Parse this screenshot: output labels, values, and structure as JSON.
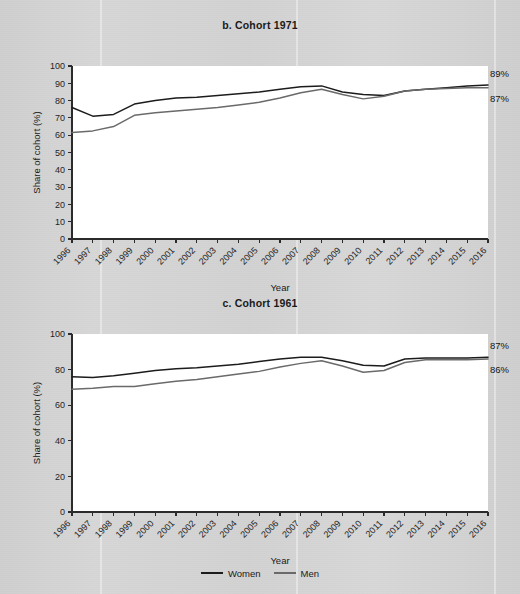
{
  "figure": {
    "axis_x_title": "Year",
    "axis_y_title": "Share of cohort (%)",
    "legend": [
      {
        "label": "Women",
        "color": "#1c1c1c",
        "key": "women"
      },
      {
        "label": "Men",
        "color": "#6a6a6a",
        "key": "men"
      }
    ]
  },
  "chart_data": [
    {
      "id": "panel-b",
      "type": "line",
      "title": "b.  Cohort 1971",
      "xlabel": "Year",
      "ylabel": "Share of cohort (%)",
      "grid": false,
      "legend_position": "bottom",
      "xlim": [
        1996,
        2016
      ],
      "ylim": [
        0,
        100
      ],
      "yticks": [
        0,
        10,
        20,
        30,
        40,
        50,
        60,
        70,
        80,
        90,
        100
      ],
      "ytick_labels": [
        "0",
        "10",
        "20",
        "30",
        "40",
        "50",
        "60",
        "70",
        "80",
        "90",
        "100"
      ],
      "x": [
        1996,
        1997,
        1998,
        1999,
        2000,
        2001,
        2002,
        2003,
        2004,
        2005,
        2006,
        2007,
        2008,
        2009,
        2010,
        2011,
        2012,
        2013,
        2014,
        2015,
        2016
      ],
      "xtick_labels": [
        "1996",
        "1997",
        "1998",
        "1999",
        "2000",
        "2001",
        "2002",
        "2003",
        "2004",
        "2005",
        "2006",
        "2007",
        "2008",
        "2009",
        "2010",
        "2011",
        "2012",
        "2013",
        "2014",
        "2015",
        "2016"
      ],
      "series": [
        {
          "name": "Women",
          "key": "women",
          "color": "#1c1c1c",
          "values": [
            76,
            71,
            72,
            78,
            80,
            81.5,
            82,
            83,
            84,
            85,
            86.5,
            88,
            88.5,
            85,
            83.5,
            83,
            85.5,
            86.5,
            87.5,
            88.5,
            89
          ],
          "end_label": "89%"
        },
        {
          "name": "Men",
          "key": "men",
          "color": "#6a6a6a",
          "values": [
            61.5,
            62.5,
            65,
            71.5,
            73,
            74,
            75,
            76,
            77.5,
            79,
            81.5,
            84.5,
            86.5,
            83.5,
            81,
            82.5,
            85.5,
            86.5,
            87,
            87.5,
            87.5
          ],
          "end_label": "87%"
        }
      ]
    },
    {
      "id": "panel-c",
      "type": "line",
      "title": "c. Cohort 1961",
      "xlabel": "Year",
      "ylabel": "Share of cohort (%)",
      "grid": false,
      "legend_position": "bottom",
      "xlim": [
        1996,
        2016
      ],
      "ylim": [
        0,
        100
      ],
      "yticks": [
        0,
        20,
        40,
        60,
        80,
        100
      ],
      "ytick_labels": [
        "0",
        "20",
        "40",
        "60",
        "80",
        "100"
      ],
      "x": [
        1996,
        1997,
        1998,
        1999,
        2000,
        2001,
        2002,
        2003,
        2004,
        2005,
        2006,
        2007,
        2008,
        2009,
        2010,
        2011,
        2012,
        2013,
        2014,
        2015,
        2016
      ],
      "xtick_labels": [
        "1996",
        "1997",
        "1998",
        "1999",
        "2000",
        "2001",
        "2002",
        "2003",
        "2004",
        "2005",
        "2006",
        "2007",
        "2008",
        "2009",
        "2010",
        "2011",
        "2012",
        "2013",
        "2014",
        "2015",
        "2016"
      ],
      "series": [
        {
          "name": "Women",
          "key": "women",
          "color": "#1c1c1c",
          "values": [
            76,
            75.5,
            76.5,
            78,
            79.5,
            80.5,
            81,
            82,
            83,
            84.5,
            86,
            87,
            87,
            85,
            82.5,
            82,
            86,
            86.5,
            86.5,
            86.5,
            87
          ],
          "end_label": "87%"
        },
        {
          "name": "Men",
          "key": "men",
          "color": "#6a6a6a",
          "values": [
            69,
            69.5,
            70.5,
            70.5,
            72,
            73.5,
            74.5,
            76,
            77.5,
            79,
            81.5,
            83.5,
            85,
            82,
            78.5,
            79.5,
            84,
            85.5,
            85.5,
            85.5,
            86
          ],
          "end_label": "86%"
        }
      ]
    }
  ]
}
